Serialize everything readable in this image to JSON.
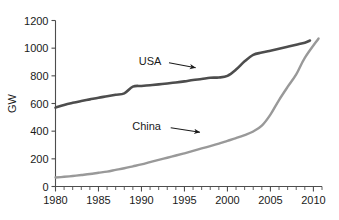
{
  "chart_data": {
    "type": "line",
    "title": "",
    "subtitle": "",
    "xlabel": "",
    "ylabel": "GW",
    "xlim": [
      1980,
      2011
    ],
    "ylim": [
      0,
      1200
    ],
    "grid": false,
    "legend_position": "inline-annotations",
    "x_ticks": [
      1980,
      1985,
      1990,
      1995,
      2000,
      2005,
      2010
    ],
    "x_tick_labels": [
      "1980",
      "1985",
      "1990",
      "1995",
      "2000",
      "2005",
      "2010"
    ],
    "x_minor_tick_step": 1,
    "y_ticks": [
      0,
      200,
      400,
      600,
      800,
      1000,
      1200
    ],
    "y_tick_labels": [
      "0",
      "200",
      "400",
      "600",
      "800",
      "1000",
      "1200"
    ],
    "x": [
      1980,
      1981,
      1982,
      1983,
      1984,
      1985,
      1986,
      1987,
      1988,
      1989,
      1990,
      1991,
      1992,
      1993,
      1994,
      1995,
      1996,
      1997,
      1998,
      1999,
      2000,
      2001,
      2002,
      2003,
      2004,
      2005,
      2006,
      2007,
      2008,
      2009,
      2010
    ],
    "series": [
      {
        "name": "USA",
        "color": "#4d4d4d",
        "width": 2.6,
        "label_x": 1991.0,
        "label_y": 905,
        "arrow_from_x": 1993.2,
        "arrow_from_y": 895,
        "arrow_to_x": 1996.3,
        "arrow_to_y": 858,
        "values": [
          570,
          590,
          605,
          618,
          630,
          642,
          652,
          663,
          673,
          722,
          727,
          732,
          738,
          745,
          752,
          760,
          770,
          777,
          786,
          788,
          800,
          845,
          905,
          952,
          968,
          982,
          996,
          1010,
          1025,
          1040,
          1055
        ],
        "x_end": 2009.6,
        "y_end": 1055
      },
      {
        "name": "China",
        "color": "#999999",
        "width": 2.4,
        "label_x": 1990.6,
        "label_y": 435,
        "arrow_from_x": 1993.4,
        "arrow_from_y": 425,
        "arrow_to_x": 1996.8,
        "arrow_to_y": 392,
        "values": [
          65,
          70,
          76,
          83,
          90,
          99,
          108,
          120,
          132,
          146,
          160,
          176,
          192,
          208,
          224,
          240,
          257,
          275,
          292,
          310,
          330,
          350,
          372,
          398,
          440,
          520,
          625,
          720,
          810,
          930,
          1070
        ],
        "x_end": 2010.6,
        "y_end": 1070
      }
    ]
  }
}
